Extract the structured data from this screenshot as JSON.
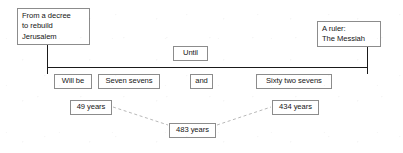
{
  "diagram": {
    "endpoints": {
      "start_label": "From a decree\nto rebuild\nJerusalem",
      "end_label": "A ruler:\nThe Messiah"
    },
    "axis_label": "Until",
    "segments": [
      {
        "label": "Will be"
      },
      {
        "label": "Seven sevens"
      },
      {
        "label": "and"
      },
      {
        "label": "Sixty two sevens"
      }
    ],
    "durations": {
      "first": "49 years",
      "second": "434 years",
      "total": "483 years"
    },
    "colors": {
      "line": "#1a1a1a",
      "box_border": "#8c8c8c",
      "text": "#151515",
      "connector": "#b9b9b9",
      "background": "#ffffff"
    }
  }
}
